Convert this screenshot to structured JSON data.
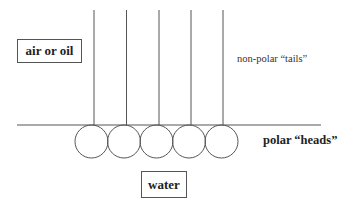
{
  "diagram": {
    "type": "surfactant monolayer at interface",
    "upper_phase_label": "air or oil",
    "lower_phase_label": "water",
    "tails_label": "non-polar “tails”",
    "heads_label": "polar “heads”",
    "molecule_count": 5,
    "colors": {
      "line": "#555555",
      "text": "#222222",
      "background": "#ffffff"
    }
  }
}
